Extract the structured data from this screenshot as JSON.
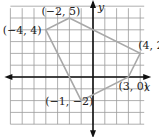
{
  "figure": {
    "type": "coordinate-plane-polygon",
    "axes": {
      "x_label": "x",
      "y_label": "y"
    },
    "grid": {
      "x_min": -7,
      "x_max": 4,
      "y_min": -4,
      "y_max": 6,
      "step": 1
    },
    "vertices": [
      {
        "x": -2,
        "y": 5,
        "label": "(−2, 5)"
      },
      {
        "x": 4,
        "y": 2,
        "label": "(4, 2)"
      },
      {
        "x": 3,
        "y": 0,
        "label": "(3, 0)"
      },
      {
        "x": -1,
        "y": -2,
        "label": "(−1, −2)"
      },
      {
        "x": -4,
        "y": 4,
        "label": "(−4, 4)"
      }
    ],
    "colors": {
      "grid": "#9a9a9a",
      "axes": "#111111",
      "polygon": "#a8a8a8",
      "text": "#222222"
    }
  }
}
